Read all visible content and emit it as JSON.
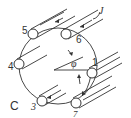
{
  "diagram": {
    "type": "circular arrangement of rods",
    "colors": {
      "stroke": "#333333",
      "background": "#ffffff"
    },
    "nodes": [
      {
        "id": "1",
        "label": "1"
      },
      {
        "id": "3",
        "label": "3"
      },
      {
        "id": "4",
        "label": "4"
      },
      {
        "id": "5",
        "label": "5"
      },
      {
        "id": "6",
        "label": "6"
      },
      {
        "id": "7",
        "label": "7"
      }
    ],
    "labels": {
      "angle": "φ",
      "corner": "C",
      "top_right": "J"
    }
  }
}
